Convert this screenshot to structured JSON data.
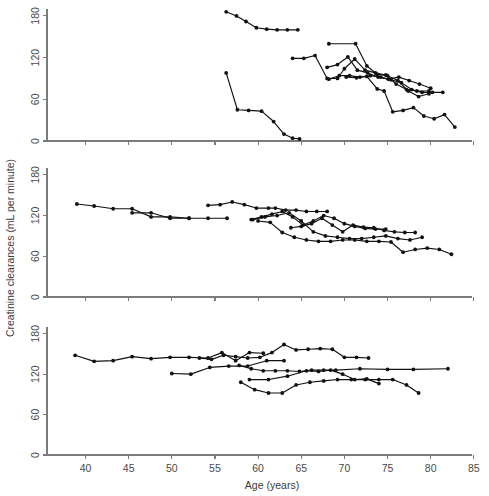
{
  "figure": {
    "title": "",
    "x_axis_title": "Age (years)",
    "y_axis_title": "Creatinine clearances (mL per minute)",
    "marker": "filled-circle",
    "line_color": "#111111",
    "axis_color": "#7b7b7b"
  },
  "chart_data": {
    "type": "line",
    "title": "",
    "xlabel": "Age (years)",
    "ylabel": "Creatinine clearances (mL per minute)",
    "xlim": [
      37,
      85
    ],
    "ylim": [
      0,
      190
    ],
    "xticks": [
      40,
      45,
      50,
      55,
      60,
      65,
      70,
      75,
      80,
      85
    ],
    "yticks": [
      0,
      60,
      120,
      180
    ],
    "grid": false,
    "legend": "none",
    "panels": [
      {
        "panel": 1,
        "name": "panel-top",
        "series": [
          {
            "name": "subject-1-top",
            "x": [
              56.3,
              57.5,
              58.6,
              59.8,
              61.0,
              62.2,
              63.4,
              64.6
            ],
            "y": [
              186,
              180,
              172,
              163,
              161,
              160,
              160,
              160
            ]
          },
          {
            "name": "subject-2-steep-decline",
            "x": [
              56.3,
              57.6,
              58.9,
              60.4,
              61.8,
              63.0,
              64.0,
              64.8
            ],
            "y": [
              98,
              45,
              44,
              43,
              28,
              10,
              4,
              3
            ]
          },
          {
            "name": "subject-3-mid",
            "x": [
              64.0,
              65.3,
              66.6,
              68.0,
              69.2,
              70.0,
              71.2,
              72.4,
              73.6,
              74.8,
              76.0,
              77.2,
              78.4,
              79.8
            ],
            "y": [
              119,
              119,
              123,
              90,
              90,
              104,
              118,
              102,
              98,
              95,
              82,
              74,
              72,
              72
            ]
          },
          {
            "name": "subject-4-high-start",
            "x": [
              68.2,
              71.3,
              72.6,
              73.8,
              75.0,
              76.2,
              77.4,
              78.6,
              79.8
            ],
            "y": [
              140,
              140,
              108,
              96,
              94,
              87,
              72,
              64,
              68
            ]
          },
          {
            "name": "subject-5",
            "x": [
              68.0,
              69.2,
              70.4,
              71.5,
              72.7,
              73.9,
              75.1,
              76.3,
              77.5,
              78.7,
              80.0
            ],
            "y": [
              106,
              110,
              121,
              102,
              98,
              92,
              89,
              92,
              87,
              82,
              76
            ]
          },
          {
            "name": "subject-6",
            "x": [
              68.2,
              69.4,
              70.6,
              71.8,
              73.0,
              74.2,
              75.4,
              76.6,
              77.8,
              79.0,
              80.2,
              81.4
            ],
            "y": [
              89,
              94,
              94,
              92,
              94,
              92,
              88,
              84,
              74,
              70,
              70,
              70
            ]
          },
          {
            "name": "subject-7-low-tail",
            "x": [
              70.2,
              71.4,
              72.6,
              73.8,
              74.6,
              75.6,
              76.8,
              78.0,
              79.2,
              80.4,
              81.6,
              82.8
            ],
            "y": [
              92,
              91,
              93,
              75,
              72,
              42,
              44,
              48,
              36,
              32,
              38,
              20
            ]
          }
        ]
      },
      {
        "panel": 2,
        "name": "panel-middle",
        "series": [
          {
            "name": "subject-8",
            "x": [
              39.0,
              41.0,
              43.2,
              45.4,
              47.6,
              49.8,
              52.0,
              54.2,
              56.4
            ],
            "y": [
              137,
              134,
              130,
              130,
              118,
              118,
              116,
              116,
              116
            ]
          },
          {
            "name": "subject-9",
            "x": [
              45.4,
              47.6,
              49.8,
              52.0
            ],
            "y": [
              124,
              124,
              116,
              116
            ]
          },
          {
            "name": "subject-10",
            "x": [
              54.2,
              55.6,
              57.0,
              58.4,
              59.8,
              61.2,
              62.0,
              63.2,
              64.4,
              65.6,
              66.8,
              68.0
            ],
            "y": [
              135,
              136,
              140,
              136,
              131,
              131,
              131,
              128,
              128,
              126,
              126,
              126
            ]
          },
          {
            "name": "subject-11",
            "x": [
              59.2,
              60.4,
              61.6,
              62.8,
              64.0,
              65.2,
              66.4,
              67.6,
              68.8,
              70.0,
              71.2,
              72.4,
              73.6,
              74.8
            ],
            "y": [
              114,
              118,
              122,
              126,
              118,
              106,
              112,
              120,
              116,
              108,
              104,
              101,
              100,
              100
            ]
          },
          {
            "name": "subject-12",
            "x": [
              63.8,
              65.0,
              66.2,
              67.4,
              68.6,
              69.8,
              71.0,
              72.2,
              73.4,
              74.6,
              75.8,
              77.0,
              78.2
            ],
            "y": [
              102,
              104,
              108,
              116,
              106,
              96,
              106,
              103,
              102,
              98,
              96,
              95,
              95
            ]
          },
          {
            "name": "subject-13",
            "x": [
              59.4,
              60.8,
              62.2,
              63.6,
              65.0,
              66.4,
              67.8,
              69.2,
              70.6,
              72.0,
              73.4,
              74.8,
              76.2,
              77.6,
              79.0
            ],
            "y": [
              114,
              118,
              120,
              124,
              112,
              96,
              90,
              88,
              86,
              86,
              88,
              90,
              86,
              84,
              88
            ]
          },
          {
            "name": "subject-14",
            "x": [
              60.0,
              61.4,
              62.8,
              64.2,
              65.6,
              67.0,
              68.4,
              69.8,
              71.2,
              72.6,
              74.0,
              75.4,
              76.8,
              78.2,
              79.6,
              81.0,
              82.4
            ],
            "y": [
              112,
              110,
              95,
              88,
              84,
              82,
              82,
              84,
              84,
              82,
              82,
              81,
              66,
              70,
              72,
              70,
              63
            ]
          }
        ]
      },
      {
        "panel": 3,
        "name": "panel-bottom",
        "series": [
          {
            "name": "subject-15",
            "x": [
              38.8,
              41.0,
              43.2,
              45.4,
              47.6,
              49.8,
              52.0,
              54.2,
              55.8,
              57.4,
              59.0,
              60.6
            ],
            "y": [
              148,
              139,
              140,
              146,
              143,
              145,
              145,
              144,
              152,
              140,
              152,
              151
            ]
          },
          {
            "name": "subject-16",
            "x": [
              53.2,
              54.6,
              56.0,
              57.4,
              58.8,
              60.2,
              61.6,
              63.0,
              64.4,
              65.8,
              67.2,
              68.6,
              70.0,
              71.4,
              72.8
            ],
            "y": [
              144,
              142,
              148,
              146,
              144,
              145,
              152,
              164,
              156,
              157,
              158,
              157,
              145,
              145,
              144
            ]
          },
          {
            "name": "subject-17",
            "x": [
              50.0,
              52.2,
              54.4,
              56.6,
              58.8,
              61.0,
              63.0
            ],
            "y": [
              121,
              120,
              130,
              132,
              132,
              140,
              140
            ]
          },
          {
            "name": "subject-18",
            "x": [
              57.8,
              59.2,
              60.6,
              62.0,
              63.4,
              64.8,
              66.2,
              67.6,
              69.0,
              71.8,
              75.0,
              78.0,
              82.0
            ],
            "y": [
              133,
              128,
              125,
              125,
              125,
              124,
              126,
              126,
              126,
              128,
              127,
              127,
              128
            ]
          },
          {
            "name": "subject-19",
            "x": [
              59.0,
              61.2,
              63.4,
              65.6,
              67.0,
              68.4,
              69.8,
              71.2,
              72.6,
              74.0
            ],
            "y": [
              112,
              112,
              117,
              125,
              124,
              126,
              120,
              112,
              113,
              106
            ]
          },
          {
            "name": "subject-20",
            "x": [
              58.0,
              59.6,
              61.2,
              62.8,
              64.4,
              66.0,
              67.6,
              69.2,
              70.8,
              72.4,
              74.0,
              75.6,
              77.2,
              78.6
            ],
            "y": [
              108,
              97,
              92,
              92,
              104,
              108,
              110,
              112,
              112,
              112,
              112,
              112,
              104,
              92
            ]
          }
        ]
      }
    ]
  }
}
